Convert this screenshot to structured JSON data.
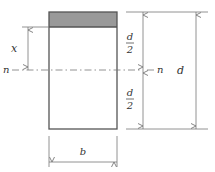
{
  "diagram": {
    "labels": {
      "x": "x",
      "n_left": "n",
      "n_right": "n",
      "d_half_top_num": "d",
      "d_half_top_den": "2",
      "d_half_bottom_num": "d",
      "d_half_bottom_den": "2",
      "d": "d",
      "b": "b"
    },
    "colors": {
      "line": "#555555",
      "shade": "#999999",
      "dim": "#777777",
      "text": "#333333"
    }
  }
}
